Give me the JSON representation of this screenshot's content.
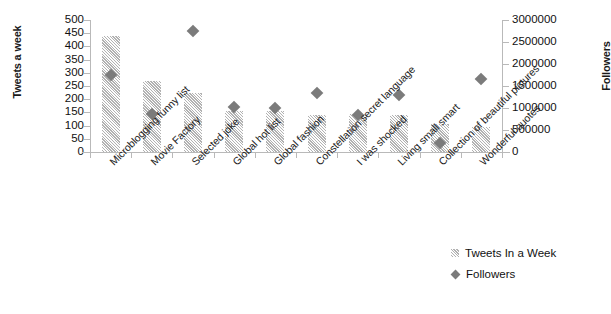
{
  "chart_data": {
    "type": "bar",
    "title": "",
    "subtitle": "",
    "xlabel": "",
    "ylabel": "Tweets a week",
    "y2label": "Followers",
    "grid": false,
    "legend_position": "bottom-right",
    "categories": [
      "Microblogging funny list",
      "Movie Factory",
      "Selected joke",
      "Global hot list",
      "Global fashion",
      "Constellation secret language",
      "I was shocked",
      "Living small smart",
      "Collection of beautiful pictures",
      "Wonderful quotes"
    ],
    "ylim": [
      0,
      500
    ],
    "yticks": [
      0,
      50,
      100,
      150,
      200,
      250,
      300,
      350,
      400,
      450,
      500
    ],
    "ytick_labels": [
      "0",
      "50",
      "100",
      "150",
      "200",
      "250",
      "300",
      "350",
      "400",
      "450",
      "500"
    ],
    "y2lim": [
      0,
      3000000
    ],
    "y2ticks": [
      0,
      500000,
      1000000,
      1500000,
      2000000,
      2500000,
      3000000
    ],
    "y2tick_labels": [
      "0",
      "500000",
      "1000000",
      "1500000",
      "2000000",
      "2500000",
      "3000000"
    ],
    "series": [
      {
        "name": "Tweets In a Week",
        "kind": "bar",
        "axis": "left",
        "color": "#dcdcdc",
        "values": [
          440,
          270,
          225,
          155,
          155,
          140,
          145,
          140,
          105,
          95
        ]
      },
      {
        "name": "Followers",
        "kind": "scatter",
        "axis": "right",
        "color": "#7b7b7b",
        "marker": "diamond",
        "values": [
          1750000,
          860000,
          2750000,
          1020000,
          1000000,
          1350000,
          830000,
          1300000,
          200000,
          1650000
        ]
      }
    ]
  },
  "legend": {
    "items": [
      {
        "label": "Tweets In a Week",
        "marker": "bar-swatch"
      },
      {
        "label": "Followers",
        "marker": "diamond-swatch"
      }
    ]
  }
}
